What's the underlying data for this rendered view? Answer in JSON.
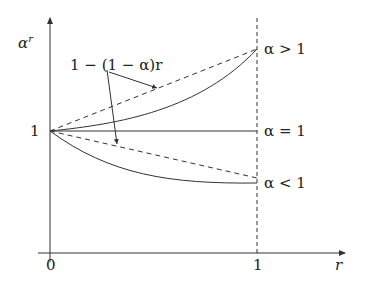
{
  "diagram": {
    "y_axis_label": "α",
    "y_axis_label_sup": "r",
    "x_axis_label": "r",
    "x_tick_0": "0",
    "x_tick_1": "1",
    "y_tick_1": "1",
    "annotation": "1 − (1 − α)r",
    "curve_labels": {
      "alpha_gt_1": "α > 1",
      "alpha_eq_1": "α = 1",
      "alpha_lt_1": "α < 1"
    },
    "colors": {
      "line": "#333333",
      "background": "#ffffff"
    }
  }
}
